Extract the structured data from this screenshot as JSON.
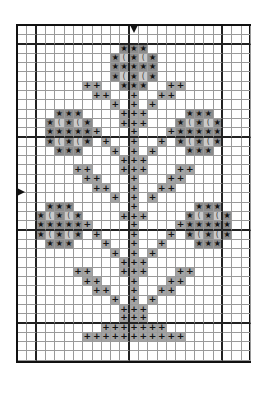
{
  "pattern": {
    "title": "",
    "cols": 25,
    "rows": 36,
    "thick_line_every": 10,
    "thick_line_offset": 2,
    "center_markers": {
      "top_col": 12,
      "left_row": 18
    },
    "colors": {
      "star_fill": "#8c8c8c",
      "moon_fill": "#c9c9c9",
      "plus_fill": "#a3a3a3",
      "grid_line": "#9a9a9a",
      "thick_line": "#222222"
    },
    "legend": [
      {
        "symbol": "star",
        "glyph": "★"
      },
      {
        "symbol": "moon",
        "glyph": "("
      },
      {
        "symbol": "plus",
        "glyph": "+"
      }
    ],
    "stitches": [
      {
        "row": 2,
        "cells": [
          [
            11,
            "star"
          ],
          [
            12,
            "star"
          ],
          [
            13,
            "star"
          ]
        ]
      },
      {
        "row": 3,
        "cells": [
          [
            10,
            "star"
          ],
          [
            11,
            "moon"
          ],
          [
            12,
            "star"
          ],
          [
            13,
            "moon"
          ],
          [
            14,
            "star"
          ]
        ]
      },
      {
        "row": 4,
        "cells": [
          [
            10,
            "star"
          ],
          [
            11,
            "star"
          ],
          [
            12,
            "star"
          ],
          [
            13,
            "star"
          ],
          [
            14,
            "star"
          ]
        ]
      },
      {
        "row": 5,
        "cells": [
          [
            10,
            "star"
          ],
          [
            11,
            "moon"
          ],
          [
            12,
            "star"
          ],
          [
            13,
            "moon"
          ],
          [
            14,
            "star"
          ]
        ]
      },
      {
        "row": 6,
        "cells": [
          [
            7,
            "plus"
          ],
          [
            8,
            "plus"
          ],
          [
            11,
            "star"
          ],
          [
            12,
            "star"
          ],
          [
            13,
            "star"
          ],
          [
            16,
            "plus"
          ],
          [
            17,
            "plus"
          ]
        ]
      },
      {
        "row": 7,
        "cells": [
          [
            8,
            "plus"
          ],
          [
            9,
            "plus"
          ],
          [
            12,
            "plus"
          ],
          [
            15,
            "plus"
          ],
          [
            16,
            "plus"
          ]
        ]
      },
      {
        "row": 8,
        "cells": [
          [
            10,
            "plus"
          ],
          [
            12,
            "plus"
          ],
          [
            14,
            "plus"
          ]
        ]
      },
      {
        "row": 9,
        "cells": [
          [
            4,
            "star"
          ],
          [
            5,
            "star"
          ],
          [
            6,
            "star"
          ],
          [
            11,
            "plus"
          ],
          [
            12,
            "plus"
          ],
          [
            13,
            "plus"
          ],
          [
            18,
            "star"
          ],
          [
            19,
            "star"
          ],
          [
            20,
            "star"
          ]
        ]
      },
      {
        "row": 10,
        "cells": [
          [
            3,
            "star"
          ],
          [
            4,
            "moon"
          ],
          [
            5,
            "star"
          ],
          [
            6,
            "moon"
          ],
          [
            7,
            "star"
          ],
          [
            11,
            "plus"
          ],
          [
            12,
            "plus"
          ],
          [
            13,
            "plus"
          ],
          [
            17,
            "star"
          ],
          [
            18,
            "moon"
          ],
          [
            19,
            "star"
          ],
          [
            20,
            "moon"
          ],
          [
            21,
            "star"
          ]
        ]
      },
      {
        "row": 11,
        "cells": [
          [
            3,
            "star"
          ],
          [
            4,
            "star"
          ],
          [
            5,
            "star"
          ],
          [
            6,
            "star"
          ],
          [
            7,
            "star"
          ],
          [
            8,
            "plus"
          ],
          [
            12,
            "plus"
          ],
          [
            16,
            "plus"
          ],
          [
            17,
            "star"
          ],
          [
            18,
            "star"
          ],
          [
            19,
            "star"
          ],
          [
            20,
            "star"
          ],
          [
            21,
            "star"
          ]
        ]
      },
      {
        "row": 12,
        "cells": [
          [
            3,
            "star"
          ],
          [
            4,
            "moon"
          ],
          [
            5,
            "star"
          ],
          [
            6,
            "moon"
          ],
          [
            7,
            "star"
          ],
          [
            9,
            "plus"
          ],
          [
            12,
            "plus"
          ],
          [
            15,
            "plus"
          ],
          [
            17,
            "star"
          ],
          [
            18,
            "moon"
          ],
          [
            19,
            "star"
          ],
          [
            20,
            "moon"
          ],
          [
            21,
            "star"
          ]
        ]
      },
      {
        "row": 13,
        "cells": [
          [
            4,
            "star"
          ],
          [
            5,
            "star"
          ],
          [
            6,
            "star"
          ],
          [
            10,
            "plus"
          ],
          [
            12,
            "plus"
          ],
          [
            14,
            "plus"
          ],
          [
            18,
            "star"
          ],
          [
            19,
            "star"
          ],
          [
            20,
            "star"
          ]
        ]
      },
      {
        "row": 14,
        "cells": [
          [
            11,
            "plus"
          ],
          [
            12,
            "plus"
          ],
          [
            13,
            "plus"
          ]
        ]
      },
      {
        "row": 15,
        "cells": [
          [
            6,
            "plus"
          ],
          [
            7,
            "plus"
          ],
          [
            11,
            "plus"
          ],
          [
            12,
            "plus"
          ],
          [
            13,
            "plus"
          ],
          [
            17,
            "plus"
          ],
          [
            18,
            "plus"
          ]
        ]
      },
      {
        "row": 16,
        "cells": [
          [
            7,
            "plus"
          ],
          [
            8,
            "plus"
          ],
          [
            12,
            "plus"
          ],
          [
            16,
            "plus"
          ],
          [
            17,
            "plus"
          ]
        ]
      },
      {
        "row": 17,
        "cells": [
          [
            8,
            "plus"
          ],
          [
            9,
            "plus"
          ],
          [
            12,
            "plus"
          ],
          [
            15,
            "plus"
          ],
          [
            16,
            "plus"
          ]
        ]
      },
      {
        "row": 18,
        "cells": [
          [
            10,
            "plus"
          ],
          [
            12,
            "plus"
          ],
          [
            14,
            "plus"
          ]
        ]
      },
      {
        "row": 19,
        "cells": [
          [
            3,
            "star"
          ],
          [
            4,
            "star"
          ],
          [
            5,
            "star"
          ],
          [
            12,
            "plus"
          ],
          [
            19,
            "star"
          ],
          [
            20,
            "star"
          ],
          [
            21,
            "star"
          ]
        ]
      },
      {
        "row": 20,
        "cells": [
          [
            2,
            "star"
          ],
          [
            3,
            "moon"
          ],
          [
            4,
            "star"
          ],
          [
            5,
            "moon"
          ],
          [
            6,
            "star"
          ],
          [
            11,
            "plus"
          ],
          [
            12,
            "plus"
          ],
          [
            13,
            "plus"
          ],
          [
            18,
            "star"
          ],
          [
            19,
            "moon"
          ],
          [
            20,
            "star"
          ],
          [
            21,
            "moon"
          ],
          [
            22,
            "star"
          ]
        ]
      },
      {
        "row": 21,
        "cells": [
          [
            2,
            "star"
          ],
          [
            3,
            "star"
          ],
          [
            4,
            "star"
          ],
          [
            5,
            "star"
          ],
          [
            6,
            "star"
          ],
          [
            7,
            "plus"
          ],
          [
            12,
            "plus"
          ],
          [
            17,
            "plus"
          ],
          [
            18,
            "star"
          ],
          [
            19,
            "star"
          ],
          [
            20,
            "star"
          ],
          [
            21,
            "star"
          ],
          [
            22,
            "star"
          ]
        ]
      },
      {
        "row": 22,
        "cells": [
          [
            2,
            "star"
          ],
          [
            3,
            "moon"
          ],
          [
            4,
            "star"
          ],
          [
            5,
            "moon"
          ],
          [
            6,
            "star"
          ],
          [
            8,
            "plus"
          ],
          [
            12,
            "plus"
          ],
          [
            16,
            "plus"
          ],
          [
            18,
            "star"
          ],
          [
            19,
            "moon"
          ],
          [
            20,
            "star"
          ],
          [
            21,
            "moon"
          ],
          [
            22,
            "star"
          ]
        ]
      },
      {
        "row": 23,
        "cells": [
          [
            3,
            "star"
          ],
          [
            4,
            "star"
          ],
          [
            5,
            "star"
          ],
          [
            9,
            "plus"
          ],
          [
            12,
            "plus"
          ],
          [
            15,
            "plus"
          ],
          [
            19,
            "star"
          ],
          [
            20,
            "star"
          ],
          [
            21,
            "star"
          ]
        ]
      },
      {
        "row": 24,
        "cells": [
          [
            10,
            "plus"
          ],
          [
            12,
            "plus"
          ],
          [
            14,
            "plus"
          ]
        ]
      },
      {
        "row": 25,
        "cells": [
          [
            11,
            "plus"
          ],
          [
            12,
            "plus"
          ],
          [
            13,
            "plus"
          ]
        ]
      },
      {
        "row": 26,
        "cells": [
          [
            6,
            "plus"
          ],
          [
            7,
            "plus"
          ],
          [
            11,
            "plus"
          ],
          [
            12,
            "plus"
          ],
          [
            13,
            "plus"
          ],
          [
            17,
            "plus"
          ],
          [
            18,
            "plus"
          ]
        ]
      },
      {
        "row": 27,
        "cells": [
          [
            7,
            "plus"
          ],
          [
            8,
            "plus"
          ],
          [
            12,
            "plus"
          ],
          [
            16,
            "plus"
          ],
          [
            17,
            "plus"
          ]
        ]
      },
      {
        "row": 28,
        "cells": [
          [
            8,
            "plus"
          ],
          [
            9,
            "plus"
          ],
          [
            12,
            "plus"
          ],
          [
            15,
            "plus"
          ],
          [
            16,
            "plus"
          ]
        ]
      },
      {
        "row": 29,
        "cells": [
          [
            10,
            "plus"
          ],
          [
            12,
            "plus"
          ],
          [
            14,
            "plus"
          ]
        ]
      },
      {
        "row": 30,
        "cells": [
          [
            11,
            "plus"
          ],
          [
            12,
            "plus"
          ],
          [
            13,
            "plus"
          ]
        ]
      },
      {
        "row": 31,
        "cells": [
          [
            11,
            "plus"
          ],
          [
            12,
            "plus"
          ],
          [
            13,
            "plus"
          ]
        ]
      },
      {
        "row": 32,
        "cells": [
          [
            9,
            "plus"
          ],
          [
            10,
            "plus"
          ],
          [
            11,
            "plus"
          ],
          [
            12,
            "plus"
          ],
          [
            13,
            "plus"
          ],
          [
            14,
            "plus"
          ],
          [
            15,
            "plus"
          ]
        ]
      },
      {
        "row": 33,
        "cells": [
          [
            7,
            "plus"
          ],
          [
            8,
            "plus"
          ],
          [
            9,
            "plus"
          ],
          [
            10,
            "plus"
          ],
          [
            11,
            "plus"
          ],
          [
            12,
            "plus"
          ],
          [
            13,
            "plus"
          ],
          [
            14,
            "plus"
          ],
          [
            15,
            "plus"
          ],
          [
            16,
            "plus"
          ],
          [
            17,
            "plus"
          ]
        ]
      }
    ]
  }
}
